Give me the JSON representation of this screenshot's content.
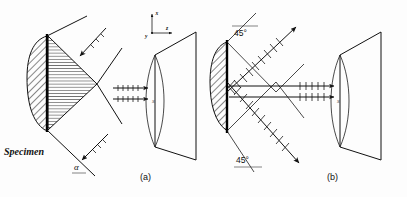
{
  "figure": {
    "background_color": "#fdfdfd",
    "ink_color": "#111111",
    "panels": [
      {
        "id": "a",
        "caption": "(a)",
        "specimen_label": "Specimen",
        "angle_label": "α",
        "beam_count_horizontal": 2,
        "beam_count_diagonal": 2,
        "description": "Oblique incidence at angle alpha with two converging diagonal beams"
      },
      {
        "id": "b",
        "caption": "(b)",
        "angle_label_top": "45°",
        "angle_label_bottom": "45°",
        "beam_count_horizontal": 2,
        "beam_count_diagonal": 2,
        "description": "Symmetric 45 degree incidence with crossing diagonal beams"
      }
    ],
    "axes": {
      "x_label": "x",
      "y_label": "y",
      "z_label": "z"
    },
    "screen": {
      "label": "S"
    }
  }
}
